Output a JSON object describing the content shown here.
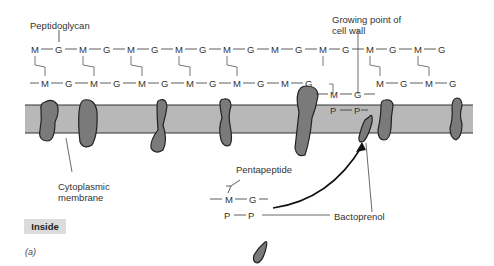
{
  "labels": {
    "peptidoglycan": "Peptidoglycan",
    "growing_point_line1": "Growing point of",
    "growing_point_line2": "cell wall",
    "cytoplasmic_line1": "Cytoplasmic",
    "cytoplasmic_line2": "membrane",
    "pentapeptide": "Pentapeptide",
    "bactoprenol": "Bactoprenol",
    "inside": "Inside",
    "figure_part": "(a)"
  },
  "chain": {
    "top_row": [
      "M",
      "G",
      "M",
      "G",
      "M",
      "G",
      "M",
      "G",
      "M",
      "G",
      "M",
      "G",
      "M",
      "G",
      "M",
      "G",
      "M",
      "G"
    ],
    "bottom_row_left": [
      "M",
      "G",
      "M",
      "G",
      "M",
      "G",
      "M",
      "G",
      "M",
      "G",
      "M",
      "G"
    ],
    "bottom_row_right": [
      "M",
      "G",
      "M",
      "G"
    ],
    "membrane_unit": {
      "top": [
        "M",
        "G"
      ],
      "bottom": [
        "P",
        "P"
      ]
    },
    "free_unit": {
      "top": [
        "M",
        "G"
      ],
      "bottom": [
        "P",
        "P"
      ]
    }
  },
  "colors": {
    "membrane": "#b8b8b8",
    "protein": "#7a7a7a",
    "outline": "#222222",
    "inside_box": "#dcdcdc"
  }
}
